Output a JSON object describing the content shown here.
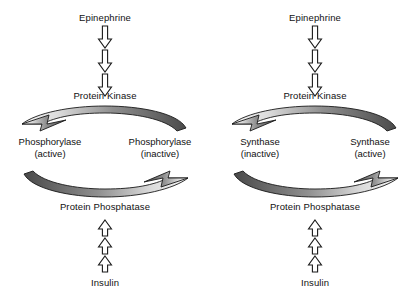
{
  "diagram": {
    "background_color": "#ffffff",
    "text_color": "#111111",
    "arrow_outline_color": "#1a1a1a",
    "arrow_fill_color": "#ffffff",
    "curve_dark_color": "#4a4a4a",
    "curve_light_color": "#e8e8e8"
  },
  "cycles": [
    {
      "id": "phosphorylase",
      "top_stimulus": "Epinephrine",
      "top_enzyme": "Protein Kinase",
      "bottom_enzyme": "Protein Phosphatase",
      "bottom_stimulus": "Insulin",
      "left_substrate": {
        "name": "Phosphorylase",
        "state": "(active)"
      },
      "right_substrate": {
        "name": "Phosphorylase",
        "state": "(inactive)"
      },
      "top_curve_direction": "right-to-left",
      "bottom_curve_direction": "left-to-right",
      "down_arrow_count": 3,
      "up_arrow_count": 3
    },
    {
      "id": "synthase",
      "top_stimulus": "Epinephrine",
      "top_enzyme": "Protein Kinase",
      "bottom_enzyme": "Protein Phosphatase",
      "bottom_stimulus": "Insulin",
      "left_substrate": {
        "name": "Synthase",
        "state": "(inactive)"
      },
      "right_substrate": {
        "name": "Synthase",
        "state": "(active)"
      },
      "top_curve_direction": "right-to-left",
      "bottom_curve_direction": "left-to-right",
      "down_arrow_count": 3,
      "up_arrow_count": 3
    }
  ]
}
